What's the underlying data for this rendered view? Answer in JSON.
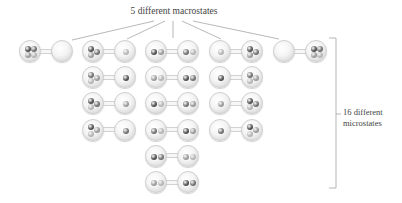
{
  "title": "5 different macrostates",
  "side_label": {
    "line1": "16 different",
    "line2": "microstates"
  },
  "colors": {
    "ball_dark": "#4e4e4e",
    "ball_mid_dark": "#6f6f6f",
    "ball_mid_light": "#999999",
    "ball_light": "#b4b4b4",
    "line": "#9a9a9a",
    "text": "#444444"
  },
  "macrostates": [
    {
      "label": "4-0",
      "microstates": [
        {
          "left": [
            "dark",
            "mid_dark",
            "mid_light",
            "light"
          ],
          "right": []
        }
      ]
    },
    {
      "label": "3-1",
      "microstates": [
        {
          "left": [
            "dark",
            "mid_dark",
            "mid_light"
          ],
          "right": [
            "light"
          ]
        },
        {
          "left": [
            "mid_dark",
            "mid_light",
            "light"
          ],
          "right": [
            "dark"
          ]
        },
        {
          "left": [
            "dark",
            "mid_dark",
            "light"
          ],
          "right": [
            "mid_light"
          ]
        },
        {
          "left": [
            "dark",
            "mid_light",
            "light"
          ],
          "right": [
            "mid_dark"
          ]
        }
      ]
    },
    {
      "label": "2-2",
      "microstates": [
        {
          "left": [
            "dark",
            "mid_light"
          ],
          "right": [
            "mid_dark",
            "light"
          ]
        },
        {
          "left": [
            "mid_light",
            "light"
          ],
          "right": [
            "dark",
            "mid_dark"
          ]
        },
        {
          "left": [
            "dark",
            "light"
          ],
          "right": [
            "mid_dark",
            "mid_light"
          ]
        },
        {
          "left": [
            "mid_dark",
            "light"
          ],
          "right": [
            "dark",
            "mid_light"
          ]
        },
        {
          "left": [
            "dark",
            "mid_dark"
          ],
          "right": [
            "mid_light",
            "light"
          ]
        },
        {
          "left": [
            "mid_light",
            "light"
          ],
          "right": [
            "dark",
            "mid_dark"
          ]
        }
      ]
    },
    {
      "label": "1-3",
      "microstates": [
        {
          "left": [
            "light"
          ],
          "right": [
            "dark",
            "mid_dark",
            "mid_light"
          ]
        },
        {
          "left": [
            "dark"
          ],
          "right": [
            "mid_dark",
            "mid_light",
            "light"
          ]
        },
        {
          "left": [
            "mid_light"
          ],
          "right": [
            "dark",
            "mid_dark",
            "light"
          ]
        },
        {
          "left": [
            "mid_dark"
          ],
          "right": [
            "dark",
            "mid_light",
            "light"
          ]
        }
      ]
    },
    {
      "label": "0-4",
      "microstates": [
        {
          "left": [],
          "right": [
            "dark",
            "mid_dark",
            "mid_light",
            "light"
          ]
        }
      ]
    }
  ],
  "total_macrostates": 5,
  "total_microstates": 16
}
